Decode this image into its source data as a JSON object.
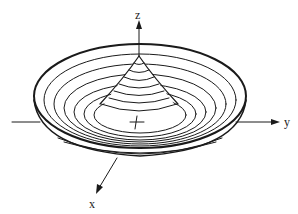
{
  "figure": {
    "type": "3d-surface-diagram",
    "stroke_color": "#1a1a1a",
    "background": "#ffffff"
  },
  "axes": {
    "x": {
      "label": "x"
    },
    "y": {
      "label": "y"
    },
    "z": {
      "label": "z"
    }
  },
  "surface": {
    "cone_level_curves": 7,
    "bowl_level_curves": 6
  }
}
